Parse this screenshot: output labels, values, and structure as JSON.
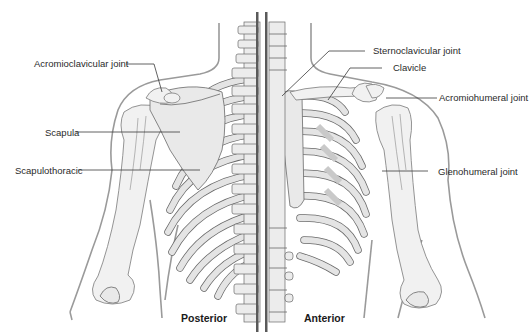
{
  "figure": {
    "type": "anatomical-diagram",
    "views": {
      "left": "Posterior",
      "right": "Anterior"
    },
    "labels": {
      "acromioclavicular": "Acromioclavicular joint",
      "scapula": "Scapula",
      "scapulothoracic": "Scapulothoracic",
      "sternoclavicular": "Sternoclavicular joint",
      "clavicle": "Clavicle",
      "acromiohumeral": "Acromiohumeral joint",
      "glenohumeral": "Glenohumeral joint"
    },
    "colors": {
      "bone_fill": "#e9e9e9",
      "bone_stroke": "#6a6a6a",
      "body_outline": "#9a9a9a",
      "leader_line": "#3a3a3a",
      "divider": "#5a5a5a",
      "text": "#2a2a2a"
    }
  }
}
